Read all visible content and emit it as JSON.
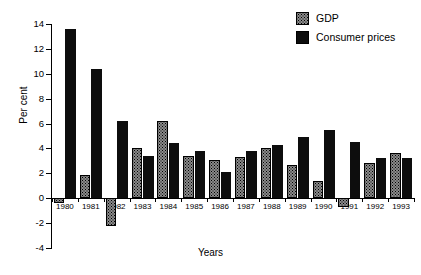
{
  "chart": {
    "title": "",
    "xlabel": "Years",
    "ylabel": "Per cent"
  },
  "legend": {
    "position": "top-right",
    "entries": [
      {
        "label": "GDP",
        "swatch": "gray-stipple-swatch",
        "color": "#8a8a8a"
      },
      {
        "label": "Consumer prices",
        "swatch": "black-swatch",
        "color": "#0d0d0d"
      }
    ]
  },
  "axis": {
    "y_ticks": [
      "14",
      "12",
      "10",
      "8",
      "6",
      "4",
      "2",
      "0",
      "-2",
      "-4"
    ],
    "y_tick_values": [
      14,
      12,
      10,
      8,
      6,
      4,
      2,
      0,
      -2,
      -4
    ],
    "ymin": -4,
    "ymax": 14
  },
  "chart_data": {
    "type": "bar",
    "title": "",
    "xlabel": "Years",
    "ylabel": "Per cent",
    "ylim": [
      -4,
      14
    ],
    "yticks": [
      -4,
      -2,
      0,
      2,
      4,
      6,
      8,
      10,
      12,
      14
    ],
    "grid": false,
    "legend_position": "top-right",
    "categories": [
      "1980",
      "1981",
      "1982",
      "1983",
      "1984",
      "1985",
      "1986",
      "1987",
      "1988",
      "1989",
      "1990",
      "1991",
      "1992",
      "1993"
    ],
    "series": [
      {
        "name": "GDP",
        "color": "#8a8a8a",
        "values": [
          -0.4,
          1.9,
          -2.2,
          4.0,
          6.2,
          3.4,
          3.1,
          3.3,
          4.0,
          2.7,
          1.4,
          -0.7,
          2.8,
          3.6
        ]
      },
      {
        "name": "Consumer prices",
        "color": "#0d0d0d",
        "values": [
          13.6,
          10.4,
          6.2,
          3.4,
          4.4,
          3.8,
          2.1,
          3.8,
          4.3,
          4.9,
          5.5,
          4.5,
          3.2,
          3.2
        ]
      }
    ]
  }
}
